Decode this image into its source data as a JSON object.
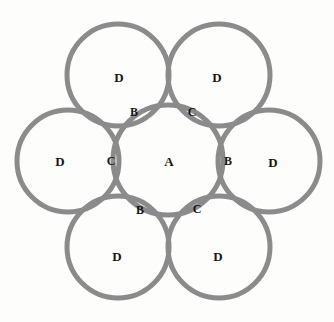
{
  "figure": {
    "width": 334,
    "height": 322,
    "background_color": "#fdfdfc",
    "stroke_color": "#8b8b8b",
    "stroke_width": 5,
    "label_color": "#161616"
  },
  "circles": [
    {
      "id": "center",
      "name": "circle-a",
      "label": "A",
      "cx": 168,
      "cy": 160,
      "r": 55
    },
    {
      "id": "top_left",
      "name": "circle-d-top-left",
      "label": "D",
      "cx": 118,
      "cy": 75,
      "r": 51
    },
    {
      "id": "top_right",
      "name": "circle-d-top-right",
      "label": "D",
      "cx": 219,
      "cy": 75,
      "r": 51
    },
    {
      "id": "left",
      "name": "circle-d-left",
      "label": "D",
      "cx": 68,
      "cy": 161,
      "r": 51
    },
    {
      "id": "right",
      "name": "circle-d-right",
      "label": "D",
      "cx": 269,
      "cy": 161,
      "r": 51
    },
    {
      "id": "bottom_left",
      "name": "circle-d-bottom-left",
      "label": "D",
      "cx": 118,
      "cy": 247,
      "r": 51
    },
    {
      "id": "bottom_right",
      "name": "circle-d-bottom-right",
      "label": "D",
      "cx": 219,
      "cy": 247,
      "r": 51
    }
  ],
  "outer_labels": [
    {
      "name": "label-d-top-left",
      "text": "D",
      "x": 119,
      "y": 77
    },
    {
      "name": "label-d-top-right",
      "text": "D",
      "x": 217,
      "y": 77
    },
    {
      "name": "label-d-left",
      "text": "D",
      "x": 60,
      "y": 161
    },
    {
      "name": "label-d-right",
      "text": "D",
      "x": 273,
      "y": 162
    },
    {
      "name": "label-d-bottom-left",
      "text": "D",
      "x": 117,
      "y": 256
    },
    {
      "name": "label-d-bottom-right",
      "text": "D",
      "x": 218,
      "y": 256
    }
  ],
  "center_label": {
    "name": "label-a-center",
    "text": "A",
    "x": 169,
    "y": 161
  },
  "junction_labels": [
    {
      "name": "label-b-top-left",
      "text": "B",
      "x": 134,
      "y": 112
    },
    {
      "name": "label-c-top-right",
      "text": "C",
      "x": 192,
      "y": 112
    },
    {
      "name": "label-c-left",
      "text": "C",
      "x": 111,
      "y": 161
    },
    {
      "name": "label-b-right",
      "text": "B",
      "x": 228,
      "y": 161
    },
    {
      "name": "label-b-bottom-left",
      "text": "B",
      "x": 140,
      "y": 210
    },
    {
      "name": "label-c-bottom-right",
      "text": "C",
      "x": 197,
      "y": 209
    }
  ]
}
